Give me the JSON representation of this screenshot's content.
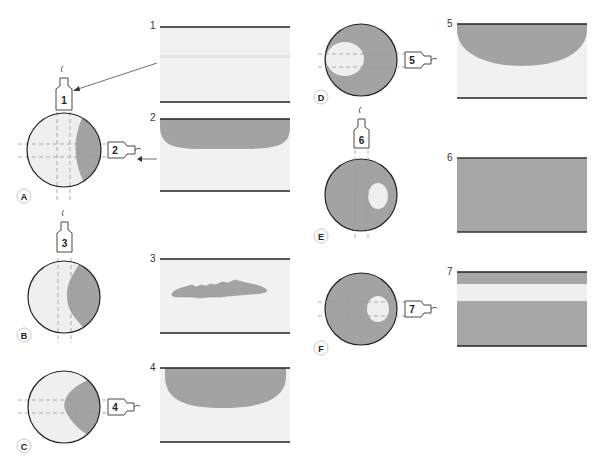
{
  "colors": {
    "dark": "#a3a3a3",
    "light": "#efefef",
    "outline": "#222222",
    "dashed": "#9a9a9a"
  },
  "diagrams": [
    {
      "label": "A",
      "probes": [
        "1",
        "2"
      ]
    },
    {
      "label": "B",
      "probes": [
        "3"
      ]
    },
    {
      "label": "C",
      "probes": [
        "4"
      ]
    },
    {
      "label": "D",
      "probes": [
        "5"
      ]
    },
    {
      "label": "E",
      "probes": [
        "6"
      ]
    },
    {
      "label": "F",
      "probes": [
        "7"
      ]
    }
  ],
  "panels": [
    {
      "number": "1",
      "content": "faint thin line (no dark region)"
    },
    {
      "number": "2",
      "content": "dark crescent region at top"
    },
    {
      "number": "3",
      "content": "thin irregular dark sliver"
    },
    {
      "number": "4",
      "content": "large dark region at top"
    },
    {
      "number": "5",
      "content": "large dark region at top"
    },
    {
      "number": "6",
      "content": "entirely dark"
    },
    {
      "number": "7",
      "content": "dark with light horizontal band"
    }
  ]
}
